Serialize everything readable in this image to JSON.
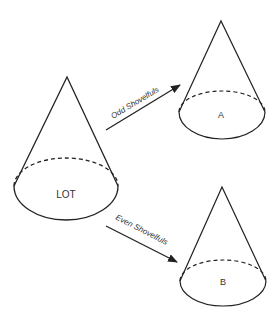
{
  "diagram": {
    "colors": {
      "stroke": "#222222",
      "text": "#333333",
      "background": "#ffffff"
    },
    "source": {
      "label": "LOT"
    },
    "targets": [
      {
        "label": "A"
      },
      {
        "label": "B"
      }
    ],
    "arrows": [
      {
        "label": "Odd Shovelfuls",
        "from": "LOT",
        "to": "A"
      },
      {
        "label": "Even Shovelfuls",
        "from": "LOT",
        "to": "B"
      }
    ]
  }
}
